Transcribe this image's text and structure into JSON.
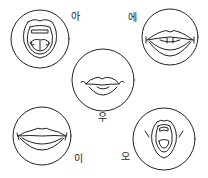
{
  "diagram": {
    "stroke_color": "#222222",
    "background": "#ffffff",
    "items": [
      {
        "id": "a",
        "label": "아",
        "shape": "wide-open-mouth-tongue-visible"
      },
      {
        "id": "e",
        "label": "에",
        "shape": "spread-lips-teeth-visible"
      },
      {
        "id": "u",
        "label": "우",
        "shape": "rounded-protruded-lips"
      },
      {
        "id": "i",
        "label": "이",
        "shape": "spread-smile-lips"
      },
      {
        "id": "o",
        "label": "오",
        "shape": "rounded-open-mouth"
      }
    ]
  }
}
